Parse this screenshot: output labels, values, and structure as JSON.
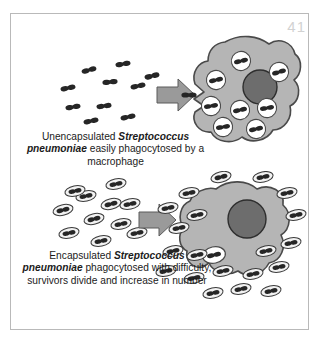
{
  "page": {
    "number": "41",
    "background_color": "#ffffff",
    "frame_color": "#b9b9b9",
    "page_number_color": "#d2d2d2"
  },
  "colors": {
    "macrophage_fill": "#b5b5b5",
    "macrophage_outline": "#4a4a4a",
    "nucleus_fill": "#6d6d6d",
    "nucleus_outline": "#2e2e2e",
    "vacuole_fill": "#ffffff",
    "vacuole_outline": "#4a4a4a",
    "bacterium_fill": "#262626",
    "capsule_fill": "#f2f2f2",
    "capsule_outline": "#3a3a3a",
    "arrow_fill": "#9a9a9a",
    "arrow_outline": "#4f4f4f",
    "text_color": "#1b1b1b"
  },
  "panels": [
    {
      "id": "top",
      "name": "unencapsulated-panel",
      "caption": {
        "lead": "Unencapsulated ",
        "organism": "Streptococcus pneumoniae",
        "tail": " easily phagocytosed by a macrophage",
        "full_text": "Unencapsulated Streptococcus pneumoniae easily phagocytosed by a macrophage"
      },
      "arrow": {
        "label": "process-arrow",
        "direction": "right"
      },
      "free_bacteria": {
        "type": "unencapsulated-diplococcus",
        "count": 10,
        "positions": [
          {
            "x": 57,
            "y": 74,
            "rot": -12
          },
          {
            "x": 78,
            "y": 56,
            "rot": -16
          },
          {
            "x": 112,
            "y": 50,
            "rot": -10
          },
          {
            "x": 99,
            "y": 68,
            "rot": -6
          },
          {
            "x": 127,
            "y": 72,
            "rot": -12
          },
          {
            "x": 62,
            "y": 93,
            "rot": -10
          },
          {
            "x": 93,
            "y": 92,
            "rot": -8
          },
          {
            "x": 80,
            "y": 107,
            "rot": -12
          },
          {
            "x": 117,
            "y": 103,
            "rot": -12
          },
          {
            "x": 141,
            "y": 62,
            "rot": -14
          }
        ]
      },
      "entering_bacterium": {
        "x": 181,
        "y": 81,
        "rot": 0
      },
      "macrophage": {
        "name": "macrophage-with-engulfed-bacteria",
        "nucleus": {
          "cx": 249,
          "cy": 73,
          "r": 17
        },
        "vacuoles": {
          "count": 8,
          "positions": [
            {
              "x": 230,
              "y": 47,
              "rot": -14
            },
            {
              "x": 268,
              "y": 58,
              "rot": -16
            },
            {
              "x": 205,
              "y": 66,
              "rot": -12
            },
            {
              "x": 200,
              "y": 92,
              "rot": -10
            },
            {
              "x": 229,
              "y": 96,
              "rot": -12
            },
            {
              "x": 256,
              "y": 94,
              "rot": -10
            },
            {
              "x": 212,
              "y": 113,
              "rot": -10
            },
            {
              "x": 245,
              "y": 115,
              "rot": -12
            }
          ]
        }
      }
    },
    {
      "id": "bottom",
      "name": "encapsulated-panel",
      "caption": {
        "lead": "Encapsulated ",
        "organism": "Streptococcus pneumoniae",
        "tail": " phagocytosed with difficulty, survivors divide and increase in number",
        "full_text": "Encapsulated Streptococcus pneumoniae phagocytosed with difficulty, survivors divide and increase in number"
      },
      "arrow": {
        "label": "process-arrow",
        "direction": "right"
      },
      "free_bacteria_left": {
        "type": "encapsulated-diplococcus",
        "count": 11,
        "positions": [
          {
            "x": 52,
            "y": 39,
            "rot": -14
          },
          {
            "x": 75,
            "y": 25,
            "rot": -12
          },
          {
            "x": 100,
            "y": 33,
            "rot": -14
          },
          {
            "x": 83,
            "y": 48,
            "rot": -14
          },
          {
            "x": 110,
            "y": 53,
            "rot": -12
          },
          {
            "x": 58,
            "y": 62,
            "rot": -12
          },
          {
            "x": 90,
            "y": 70,
            "rot": -12
          },
          {
            "x": 119,
            "y": 33,
            "rot": -12
          },
          {
            "x": 64,
            "y": 20,
            "rot": -12
          },
          {
            "x": 105,
            "y": 13,
            "rot": -12
          },
          {
            "x": 126,
            "y": 62,
            "rot": -12
          }
        ]
      },
      "free_bacteria_right": {
        "type": "encapsulated-diplococcus",
        "count": 20,
        "positions": [
          {
            "x": 210,
            "y": 12,
            "rot": -14
          },
          {
            "x": 178,
            "y": 25,
            "rot": -12
          },
          {
            "x": 248,
            "y": 8,
            "rot": -12
          },
          {
            "x": 270,
            "y": 24,
            "rot": -12
          },
          {
            "x": 157,
            "y": 37,
            "rot": -12
          },
          {
            "x": 186,
            "y": 44,
            "rot": -12
          },
          {
            "x": 168,
            "y": 57,
            "rot": -12
          },
          {
            "x": 281,
            "y": 44,
            "rot": -12
          },
          {
            "x": 162,
            "y": 80,
            "rot": -12
          },
          {
            "x": 188,
            "y": 82,
            "rot": -12
          },
          {
            "x": 251,
            "y": 78,
            "rot": -12
          },
          {
            "x": 276,
            "y": 72,
            "rot": -12
          },
          {
            "x": 155,
            "y": 100,
            "rot": -12
          },
          {
            "x": 183,
            "y": 107,
            "rot": -12
          },
          {
            "x": 210,
            "y": 100,
            "rot": -12
          },
          {
            "x": 240,
            "y": 103,
            "rot": -12
          },
          {
            "x": 265,
            "y": 96,
            "rot": -12
          },
          {
            "x": 228,
            "y": 118,
            "rot": -12
          },
          {
            "x": 200,
            "y": 122,
            "rot": -12
          },
          {
            "x": 258,
            "y": 120,
            "rot": -12
          }
        ]
      },
      "macrophage": {
        "name": "macrophage-with-single-engulfed-bacterium",
        "nucleus": {
          "cx": 236,
          "cy": 48,
          "r": 19
        },
        "vacuoles": {
          "count": 1,
          "positions": [
            {
              "x": 206,
              "y": 85,
              "rot": -12
            }
          ]
        }
      }
    }
  ]
}
